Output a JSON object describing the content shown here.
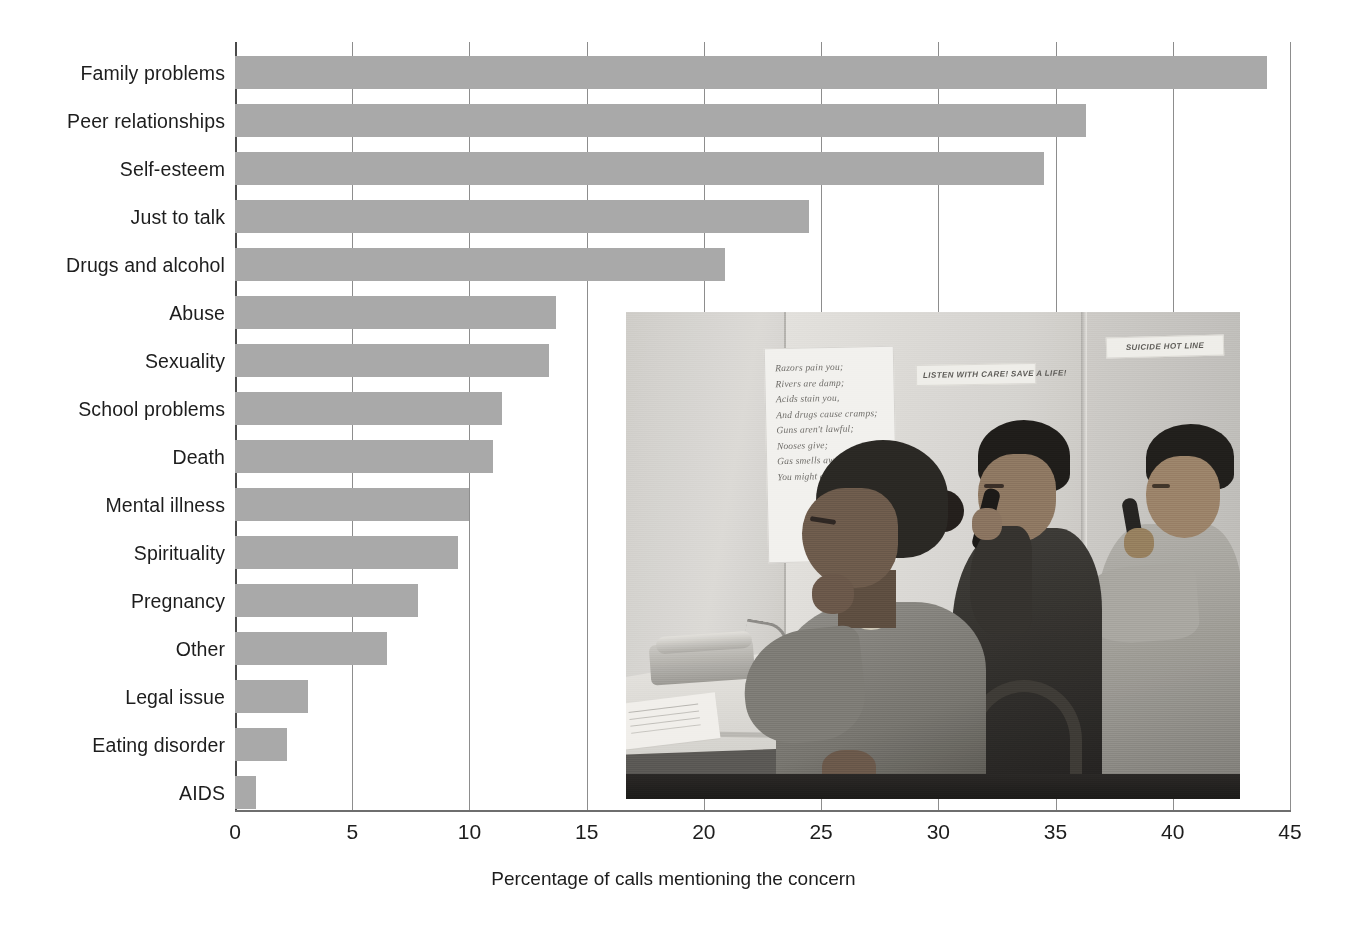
{
  "chart_data": {
    "type": "bar",
    "orientation": "horizontal",
    "title": "",
    "xlabel": "Percentage of calls mentioning the concern",
    "ylabel": "",
    "xlim": [
      0,
      45
    ],
    "xticks": [
      "0",
      "5",
      "10",
      "15",
      "20",
      "25",
      "30",
      "35",
      "40",
      "45"
    ],
    "xtick_values": [
      0,
      5,
      10,
      15,
      20,
      25,
      30,
      35,
      40,
      45
    ],
    "grid": "vertical",
    "legend": "none",
    "bar_color": "#a9a9a9",
    "categories": [
      "Family problems",
      "Peer relationships",
      "Self-esteem",
      "Just to talk",
      "Drugs and alcohol",
      "Abuse",
      "Sexuality",
      "School problems",
      "Death",
      "Mental illness",
      "Spirituality",
      "Pregnancy",
      "Other",
      "Legal issue",
      "Eating disorder",
      "AIDS"
    ],
    "values": [
      44.0,
      36.3,
      34.5,
      24.5,
      20.9,
      13.7,
      13.4,
      11.4,
      11.0,
      10.0,
      9.5,
      7.8,
      6.5,
      3.1,
      2.2,
      0.9
    ]
  },
  "axis": {
    "x_title": "Percentage of calls mentioning the concern"
  },
  "photo": {
    "caption": "",
    "poster_poem": [
      "Razors pain you;",
      "Rivers are damp;",
      "Acids stain you,",
      "And drugs cause cramps;",
      "Guns aren't lawful;",
      "Nooses give;",
      "Gas smells awful;",
      "You might as well live."
    ],
    "sign_listen": "LISTEN WITH CARE! SAVE A LIFE!",
    "sign_hotline": "SUICIDE HOT LINE"
  }
}
